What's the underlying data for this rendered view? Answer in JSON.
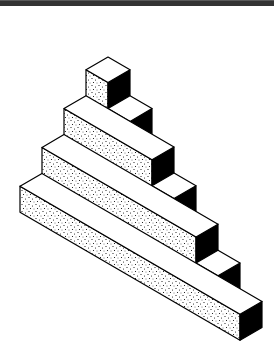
{
  "figure": {
    "colors": {
      "band": "#333333",
      "top_face": "#ffffff",
      "right_face": "#000000",
      "front_face_base": "#ffffff",
      "stipple": "#000000",
      "edge": "#000000"
    },
    "projection": {
      "origin": [
        108,
        57
      ],
      "l_vector": [
        22,
        12.8
      ],
      "d_vector": [
        -22,
        12.8
      ],
      "level_height": 26,
      "ground_level": -4
    },
    "boxes": [
      {
        "name": "top-cube",
        "l": [
          0,
          1
        ],
        "d": [
          0,
          1
        ],
        "z": [
          -4,
          0
        ]
      },
      {
        "name": "row0-step",
        "l": [
          1,
          2
        ],
        "d": [
          0,
          1
        ],
        "z": [
          -4,
          -1
        ]
      },
      {
        "name": "row1-bar",
        "l": [
          0,
          4
        ],
        "d": [
          1,
          2
        ],
        "z": [
          -4,
          -1
        ]
      },
      {
        "name": "row1-step",
        "l": [
          4,
          5
        ],
        "d": [
          1,
          2
        ],
        "z": [
          -4,
          -2
        ]
      },
      {
        "name": "row2-bar",
        "l": [
          0,
          7
        ],
        "d": [
          2,
          3
        ],
        "z": [
          -4,
          -2
        ]
      },
      {
        "name": "row2-step",
        "l": [
          7,
          8
        ],
        "d": [
          2,
          3
        ],
        "z": [
          -4,
          -3
        ]
      },
      {
        "name": "row3-bar",
        "l": [
          0,
          10
        ],
        "d": [
          3,
          4
        ],
        "z": [
          -4,
          -3
        ]
      }
    ],
    "caption": "Stepped isometric blocks"
  }
}
